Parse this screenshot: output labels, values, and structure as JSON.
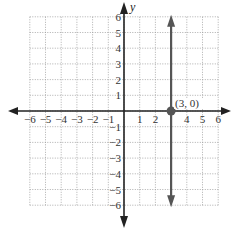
{
  "chart_data": {
    "type": "line",
    "title": "",
    "xlabel": "",
    "ylabel": "y",
    "xlim": [
      -6,
      6
    ],
    "ylim": [
      -6,
      6
    ],
    "grid": true,
    "x_ticks": [
      "-6",
      "-5",
      "-4",
      "-3",
      "-2",
      "-1",
      "1",
      "2",
      "4",
      "5",
      "6"
    ],
    "y_ticks": [
      "6",
      "5",
      "4",
      "3",
      "2",
      "1",
      "-1",
      "-2",
      "-3",
      "-4",
      "-5",
      "-6"
    ],
    "series": [
      {
        "name": "x = 3",
        "kind": "vertical-line",
        "x": 3,
        "y_range": [
          -6,
          6
        ]
      }
    ],
    "points": [
      {
        "x": 3,
        "y": 0,
        "label": "(3, 0)"
      }
    ],
    "colors": {
      "line": "#555555",
      "axis": "#222222",
      "grid": "#999999"
    }
  }
}
